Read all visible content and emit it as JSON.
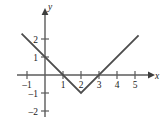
{
  "figure": {
    "background": "#ffffff",
    "axis_color": "#5b5b5b",
    "curve_color": "#4d4d4d",
    "text_color": "#1a1a1a",
    "width": 165,
    "height": 126
  },
  "axes": {
    "x_axis_label": "x",
    "y_axis_label": "y",
    "x_tick_labels": [
      "-1",
      "1",
      "2",
      "3",
      "4",
      "5"
    ],
    "y_tick_labels": [
      "2",
      "1",
      "-1",
      "-2"
    ],
    "x_origin_label": "",
    "arrowheads": [
      "x-positive",
      "y-positive"
    ]
  },
  "chart_data": {
    "type": "line",
    "title": "",
    "subtitle": "",
    "xlabel": "x",
    "ylabel": "y",
    "xlim": [
      -1.6,
      6.1
    ],
    "ylim": [
      -2.6,
      2.8
    ],
    "xticks": [
      -1,
      1,
      2,
      3,
      4,
      5
    ],
    "yticks": [
      2,
      1,
      -1,
      -2
    ],
    "xtick_labels": [
      "-1",
      "1",
      "2",
      "3",
      "4",
      "5"
    ],
    "ytick_labels": [
      "2",
      "1",
      "-1",
      "-2"
    ],
    "grid": false,
    "legend": null,
    "legend_position": "none",
    "annotations": [],
    "series": [
      {
        "name": "y = |x - 2| - 1",
        "type": "line",
        "color": "#4d4d4d",
        "x": [
          -1.3,
          2.0,
          5.2
        ],
        "y": [
          2.3,
          -1.0,
          2.2
        ],
        "vertex": [
          2,
          -1
        ],
        "x_intercepts": [
          1,
          3
        ],
        "y_intercept": 1,
        "slopes": [
          -1,
          1
        ]
      }
    ]
  }
}
